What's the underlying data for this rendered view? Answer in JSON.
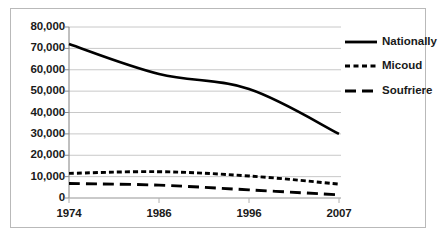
{
  "chart_data": {
    "type": "line",
    "title": "",
    "xlabel": "",
    "ylabel": "",
    "categories": [
      "1974",
      "1986",
      "1996",
      "2007"
    ],
    "x_tick_labels": [
      "1974",
      "1986",
      "1996",
      "2007"
    ],
    "y_tick_labels": [
      "0",
      "10,000",
      "20,000",
      "30,000",
      "40,000",
      "50,000",
      "60,000",
      "70,000",
      "80,000"
    ],
    "y_ticks": [
      0,
      10000,
      20000,
      30000,
      40000,
      50000,
      60000,
      70000,
      80000
    ],
    "ylim": [
      0,
      80000
    ],
    "grid": "horizontal",
    "legend_position": "right",
    "series": [
      {
        "name": "Nationally",
        "style": "solid",
        "color": "#000000",
        "values": [
          72000,
          58000,
          51000,
          30000
        ]
      },
      {
        "name": "Micoud",
        "style": "dashed",
        "color": "#000000",
        "values": [
          11500,
          12300,
          10300,
          6500
        ]
      },
      {
        "name": "Soufriere",
        "style": "long-dash",
        "color": "#000000",
        "values": [
          6800,
          6000,
          3800,
          1500
        ]
      }
    ]
  },
  "legend": {
    "items": [
      {
        "label": "Nationally"
      },
      {
        "label": "Micoud"
      },
      {
        "label": "Soufriere"
      }
    ]
  },
  "axes": {
    "y": {
      "labels": [
        "80,000",
        "70,000",
        "60,000",
        "50,000",
        "40,000",
        "30,000",
        "20,000",
        "10,000",
        "0"
      ]
    },
    "x": {
      "labels": [
        "1974",
        "1986",
        "1996",
        "2007"
      ]
    }
  }
}
